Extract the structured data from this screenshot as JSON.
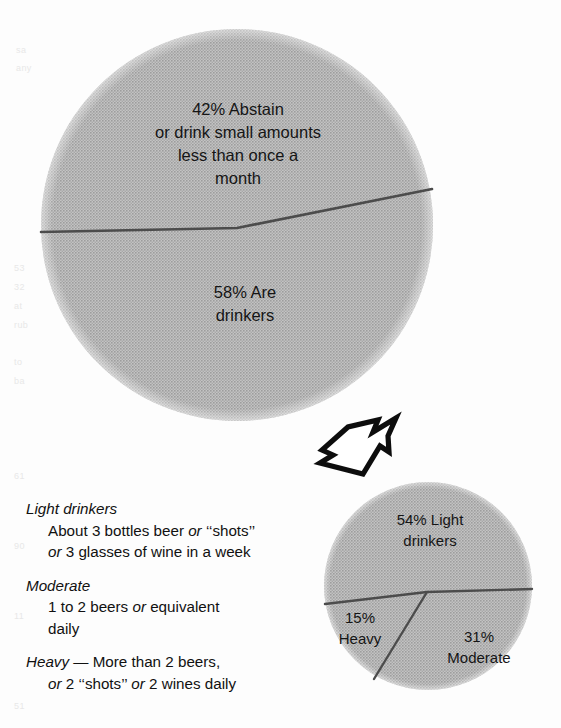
{
  "figure": {
    "background_color": "#ffffff",
    "pie_fill_color": "#b2b2b2",
    "pie_line_color": "#4a4a4a",
    "text_color": "#151515"
  },
  "main_pie": {
    "name": "drinking-population-pie",
    "slices": [
      {
        "id": "abstain",
        "percent": 42,
        "label": "42% Abstain\nor drink small amounts\nless than once a\nmonth"
      },
      {
        "id": "drinkers",
        "percent": 58,
        "label": "58% Are\ndrinkers"
      }
    ]
  },
  "detail_pie": {
    "name": "drinker-types-pie",
    "slices": [
      {
        "id": "light",
        "percent": 54,
        "label": "54% Light\ndrinkers"
      },
      {
        "id": "moderate",
        "percent": 31,
        "label": "31%\nModerate"
      },
      {
        "id": "heavy",
        "percent": 15,
        "label": "15%\nHeavy"
      }
    ]
  },
  "connector": {
    "name": "callout-arrow",
    "direction": "up-right",
    "style": "outlined"
  },
  "definitions": [
    {
      "term": "Light drinkers",
      "term_italic": true,
      "inline": false,
      "lines": [
        {
          "parts": [
            {
              "text": "About 3 bottles beer ",
              "italic": false
            },
            {
              "text": "or",
              "italic": true
            },
            {
              "text": " ‘‘shots’’",
              "italic": false
            }
          ]
        },
        {
          "parts": [
            {
              "text": "or",
              "italic": true
            },
            {
              "text": " 3 glasses of wine in a week",
              "italic": false
            }
          ]
        }
      ]
    },
    {
      "term": "Moderate",
      "term_italic": true,
      "inline": false,
      "lines": [
        {
          "parts": [
            {
              "text": "1 to 2 beers ",
              "italic": false
            },
            {
              "text": "or",
              "italic": true
            },
            {
              "text": " equivalent",
              "italic": false
            }
          ]
        },
        {
          "parts": [
            {
              "text": "daily",
              "italic": false
            }
          ]
        }
      ]
    },
    {
      "term": "Heavy",
      "term_italic": true,
      "inline": true,
      "inline_rest": " — More than 2 beers,",
      "lines": [
        {
          "parts": [
            {
              "text": "or",
              "italic": true
            },
            {
              "text": " 2 ‘‘shots’’ ",
              "italic": false
            },
            {
              "text": "or",
              "italic": true
            },
            {
              "text": " 2 wines daily",
              "italic": false
            }
          ]
        }
      ]
    }
  ],
  "chart_data": [
    {
      "type": "pie",
      "name": "main_pie",
      "title": "Drinking population",
      "categories": [
        "42% Abstain or drink small amounts less than once a month",
        "58% Are drinkers"
      ],
      "values": [
        42,
        58
      ],
      "labels": [
        "42% Abstain\nor drink small amounts\nless than once a\nmonth",
        "58% Are\ndrinkers"
      ],
      "colors": [
        "#b2b2b2",
        "#b2b2b2"
      ],
      "legend": "none",
      "grid": false,
      "annotations": [
        "Slices separated by a thin dark dividing line"
      ]
    },
    {
      "type": "pie",
      "name": "detail_pie",
      "title": "Types of drinkers",
      "categories": [
        "54% Light drinkers",
        "31% Moderate",
        "15% Heavy"
      ],
      "values": [
        54,
        31,
        15
      ],
      "labels": [
        "54% Light\ndrinkers",
        "31%\nModerate",
        "15%\nHeavy"
      ],
      "colors": [
        "#b2b2b2",
        "#b2b2b2",
        "#b2b2b2"
      ],
      "legend": "none",
      "grid": false,
      "annotations": [
        "Exploded detail of the 58% drinkers slice of the main pie"
      ]
    }
  ],
  "bleed_through": {
    "fragments": [
      "sa",
      "any",
      "53",
      "32",
      "at",
      "rub",
      "to",
      "ba",
      "61",
      "90",
      "11",
      "51"
    ]
  }
}
